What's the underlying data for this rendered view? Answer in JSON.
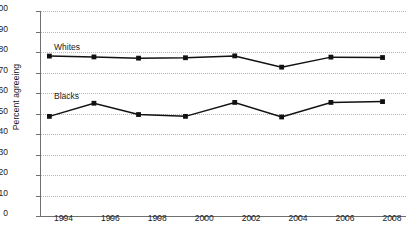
{
  "chart_data": {
    "type": "line",
    "title": "",
    "xlabel": "",
    "ylabel": "Percent agreeing",
    "ylim": [
      0,
      100
    ],
    "ytick_step": 10,
    "yticks": [
      0,
      10,
      20,
      30,
      40,
      50,
      60,
      70,
      80,
      90,
      100
    ],
    "xlim": [
      1993,
      2008.6
    ],
    "xticks": [
      1994,
      1996,
      1998,
      2000,
      2002,
      2004,
      2006,
      2008
    ],
    "xtick_labels": [
      "1994",
      "1996",
      "1998",
      "2000",
      "2002",
      "2004",
      "2006",
      "2008"
    ],
    "grid": "horizontal-dotted",
    "legend": "inline-labels",
    "x": [
      1993.4,
      1995.3,
      1997.2,
      1999.2,
      2001.3,
      2003.3,
      2005.4,
      2007.6
    ],
    "series": [
      {
        "name": "Whites",
        "color": "#111111",
        "marker": "square",
        "values": [
          78.0,
          77.6,
          77.0,
          77.2,
          78.1,
          72.6,
          77.5,
          77.3
        ],
        "label_x": 1993.6,
        "label_y": 82.5
      },
      {
        "name": "Blacks",
        "color": "#111111",
        "marker": "square",
        "values": [
          48.6,
          55.0,
          49.5,
          48.6,
          55.4,
          48.3,
          55.4,
          55.8
        ],
        "label_x": 1993.6,
        "label_y": 58.5
      }
    ]
  }
}
